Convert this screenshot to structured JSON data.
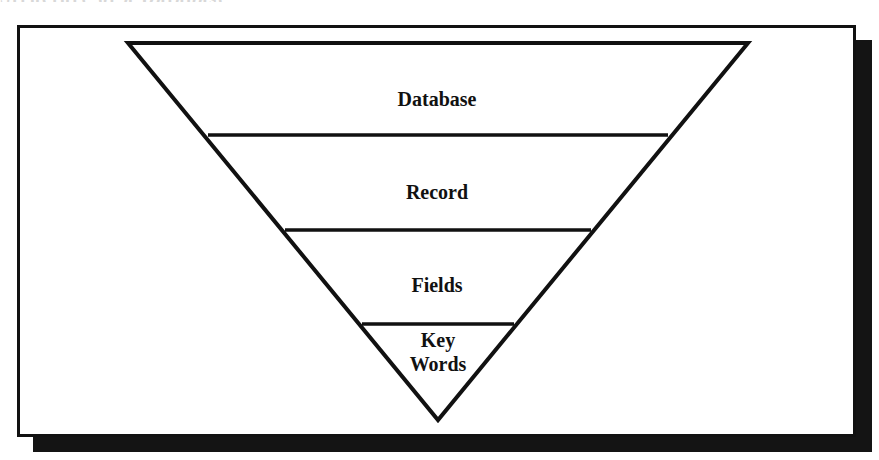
{
  "title": {
    "text": "Structure of a Database",
    "visible": "cut off at top edge"
  },
  "diagram": {
    "type": "inverted-pyramid",
    "levels": [
      {
        "label": "Database"
      },
      {
        "label": "Record"
      },
      {
        "label": "Fields"
      },
      {
        "label_line1": "Key",
        "label_line2": "Words"
      }
    ]
  },
  "colors": {
    "stroke": "#111111",
    "shadow": "#141414",
    "background": "#ffffff"
  }
}
